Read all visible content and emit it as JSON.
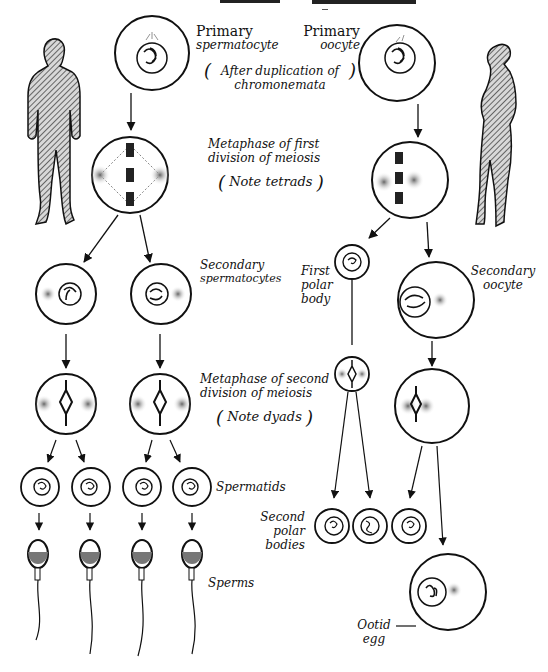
{
  "header": {
    "title_fragment": "— OOGENESIS"
  },
  "figures": {
    "male": "male-silhouette",
    "female": "female-silhouette"
  },
  "labels": {
    "primary_spermatocyte_line1": "Primary",
    "primary_spermatocyte_line2": "spermatocyte",
    "primary_oocyte_line1": "Primary",
    "primary_oocyte_line2": "oocyte",
    "note_duplication_line1": "After duplication of",
    "note_duplication_line2": "chromonemata",
    "metaphase_first_line1": "Metaphase of first",
    "metaphase_first_line2": "division of meiosis",
    "note_tetrads": "Note tetrads",
    "secondary_spermatocytes_line1": "Secondary",
    "secondary_spermatocytes_line2": "spermatocytes",
    "first_polar_body_line1": "First",
    "first_polar_body_line2": "polar",
    "first_polar_body_line3": "body",
    "secondary_oocyte_line1": "Secondary",
    "secondary_oocyte_line2": "oocyte",
    "metaphase_second_line1": "Metaphase of second",
    "metaphase_second_line2": "division of meiosis",
    "note_dyads": "Note dyads",
    "spermatids": "Spermatids",
    "second_polar_bodies_line1": "Second",
    "second_polar_bodies_line2": "polar",
    "second_polar_bodies_line3": "bodies",
    "sperms": "Sperms",
    "ootid_line1": "Ootid",
    "ootid_line2": "egg"
  },
  "stages": {
    "spermatogenesis": [
      "Primary spermatocyte",
      "Metaphase I",
      "Secondary spermatocytes (2)",
      "Metaphase II (2)",
      "Spermatids (4)",
      "Sperms (4)"
    ],
    "oogenesis": [
      "Primary oocyte",
      "Metaphase I",
      "First polar body + Secondary oocyte",
      "Metaphase II",
      "Second polar bodies (3) + Ootid egg"
    ]
  }
}
